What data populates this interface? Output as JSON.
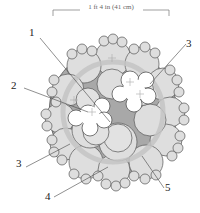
{
  "dimension": {
    "label": "1 ft 4 in (41 cm)"
  },
  "callouts": [
    {
      "id": "1",
      "label": "1"
    },
    {
      "id": "2",
      "label": "2"
    },
    {
      "id": "3a",
      "label": "3"
    },
    {
      "id": "3b",
      "label": "3"
    },
    {
      "id": "4",
      "label": "4"
    },
    {
      "id": "5",
      "label": "5"
    }
  ],
  "colors": {
    "foliage": "#dedede",
    "ring": "#c4c4c4",
    "outline": "#555555",
    "flower": "#ffffff",
    "dark_gap": "#9a9a9a"
  }
}
